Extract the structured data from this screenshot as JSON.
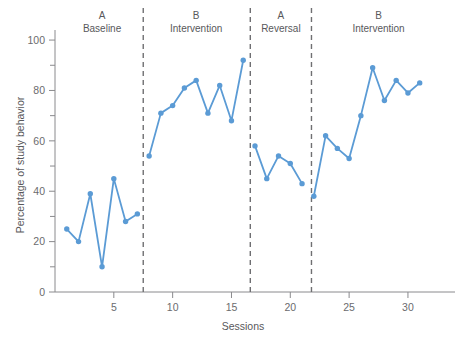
{
  "chart_data": {
    "type": "line",
    "title": "",
    "xlabel": "Sessions",
    "ylabel": "Percentage of study behavior",
    "xlim": [
      0,
      34
    ],
    "ylim": [
      0,
      104
    ],
    "grid": false,
    "legend_position": "none",
    "x_ticks": [
      5,
      10,
      15,
      20,
      25,
      30
    ],
    "x_tick_labels": [
      "5",
      "10",
      "15",
      "20",
      "25",
      "30"
    ],
    "y_ticks": [
      0,
      20,
      40,
      60,
      80,
      100
    ],
    "y_tick_labels": [
      "0",
      "20",
      "40",
      "60",
      "80",
      "100"
    ],
    "y_minor_ticks": [
      10,
      30,
      50,
      70,
      90
    ],
    "series": [
      {
        "name": "Percentage of study behavior",
        "color": "#5B9BD5",
        "x": [
          1,
          2,
          3,
          4,
          5,
          6,
          7,
          8,
          9,
          10,
          11,
          12,
          13,
          14,
          15,
          16,
          17,
          18,
          19,
          20,
          21,
          22,
          23,
          24,
          25,
          26,
          27,
          28,
          29,
          30,
          31
        ],
        "values": [
          25,
          20,
          39,
          10,
          45,
          28,
          31,
          54,
          71,
          74,
          81,
          84,
          71,
          82,
          68,
          92,
          58,
          45,
          54,
          51,
          43,
          38,
          62,
          57,
          53,
          70,
          89,
          76,
          84,
          79,
          83
        ]
      }
    ],
    "phase_dividers": [
      7.5,
      16.6,
      21.8
    ],
    "phases": [
      {
        "letter": "A",
        "name": "Baseline",
        "center_x": 4.0
      },
      {
        "letter": "B",
        "name": "Intervention",
        "center_x": 12.0
      },
      {
        "letter": "A",
        "name": "Reversal",
        "center_x": 19.2
      },
      {
        "letter": "B",
        "name": "Intervention",
        "center_x": 27.5
      }
    ]
  },
  "colors": {
    "series_blue": "#5B9BD5",
    "axis_gray": "#8a8a8d",
    "divider_gray": "#6f6f72",
    "text_gray": "#58585b",
    "background": "#ffffff"
  }
}
